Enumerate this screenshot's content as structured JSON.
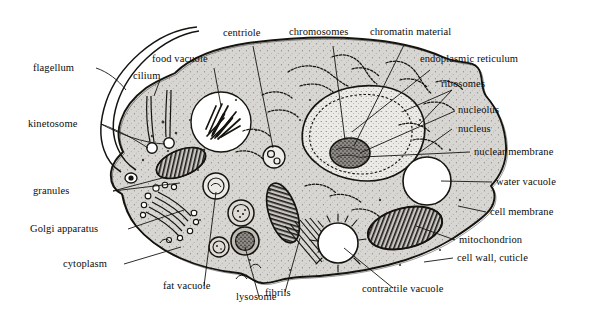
{
  "figure": {
    "background_color": "#ffffff",
    "ink_color": "#111111",
    "cytoplasm_color": "#d8d6d2",
    "nucleus_color": "#e8e6e2",
    "vacuole_color": "#ffffff"
  },
  "labels": {
    "flagellum": "flagellum",
    "cilium": "cilium",
    "kinetosome": "kinetosome",
    "food_vacuole": "food vacuole",
    "centriole": "centriole",
    "chromosomes": "chromosomes",
    "chromatin_material": "chromatin material",
    "endoplasmic_reticulum": "endoplasmic reticulum",
    "ribosomes": "ribosomes",
    "nucleolus": "nucleolus",
    "nucleus": "nucleus",
    "nuclear_membrane": "nuclear membrane",
    "water_vacuole": "water vacuole",
    "cell_membrane": "cell membrane",
    "mitochondrion": "mitochondrion",
    "cell_wall_cuticle": "cell wall, cuticle",
    "contractile_vacuole": "contractile vacuole",
    "fibrils": "fibrils",
    "lysosome": "lysosome",
    "fat_vacuole": "fat vacuole",
    "cytoplasm": "cytoplasm",
    "golgi_apparatus": "Golgi apparatus",
    "granules": "granules"
  },
  "organelles": {
    "food_vacuole": "food-vacuole-shape",
    "centriole": "centriole-shape",
    "nucleus": "nucleus-shape",
    "nucleolus": "nucleolus-shape",
    "water_vacuole": "water-vacuole-shape",
    "contractile_vacuole": "contractile-vacuole-shape",
    "golgi": "golgi-apparatus-shape",
    "mitochondria": "mitochondrion-shape",
    "fibrils": "fibril-bundle-shape",
    "lysosome": "lysosome-shape",
    "fat_vacuole": "fat-vacuole-shape",
    "kinetosome": "kinetosome-shape",
    "flagellum": "flagellum-shape",
    "cilium": "cilium-shape",
    "endoplasmic_reticulum": "endoplasmic-reticulum-shape"
  }
}
